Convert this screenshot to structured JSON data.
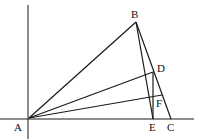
{
  "diagram": {
    "type": "geometry-figure",
    "stroke_color": "#1a1a1a",
    "background": "#ffffff",
    "points": {
      "A": {
        "label": "A",
        "x": 29,
        "y": 118
      },
      "B": {
        "label": "B",
        "x": 136,
        "y": 22
      },
      "C": {
        "label": "C",
        "x": 171,
        "y": 119
      },
      "D": {
        "label": "D",
        "x": 153,
        "y": 72
      },
      "E": {
        "label": "E",
        "x": 153,
        "y": 119
      },
      "F": {
        "label": "F",
        "x": 162,
        "y": 95
      }
    },
    "segments": [
      [
        "A",
        "B"
      ],
      [
        "B",
        "C"
      ],
      [
        "B",
        "E"
      ],
      [
        "A",
        "D"
      ],
      [
        "A",
        "F"
      ],
      [
        "D",
        "E"
      ]
    ],
    "axes": {
      "horizontal": {
        "x1": 0,
        "y": 119,
        "x2": 194
      },
      "vertical": {
        "x": 28,
        "y1": 5,
        "y2": 139
      }
    }
  }
}
